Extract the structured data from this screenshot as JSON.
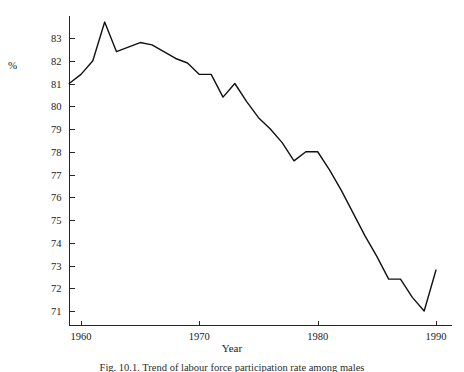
{
  "figure": {
    "caption": "Fig. 10.1. Trend of labour force participation rate among males",
    "ylabel": "%",
    "xlabel": "Year"
  },
  "chart_data": {
    "type": "line",
    "title": "",
    "xlabel": "Year",
    "ylabel": "%",
    "xlim": [
      1958,
      1990
    ],
    "ylim": [
      70.4,
      84.1
    ],
    "xticks": [
      1960,
      1970,
      1980,
      1990
    ],
    "yticks": [
      71,
      72,
      73,
      74,
      75,
      76,
      77,
      78,
      79,
      80,
      81,
      82,
      83
    ],
    "grid": false,
    "legend": null,
    "series": [
      {
        "name": "Participation rate",
        "x": [
          1959,
          1960,
          1961,
          1962,
          1963,
          1964,
          1965,
          1966,
          1967,
          1968,
          1969,
          1970,
          1971,
          1972,
          1973,
          1974,
          1975,
          1976,
          1977,
          1978,
          1979,
          1980,
          1981,
          1982,
          1983,
          1984,
          1985,
          1986,
          1987,
          1988,
          1989,
          1990
        ],
        "values": [
          81.0,
          81.4,
          82.0,
          83.7,
          82.4,
          82.6,
          82.8,
          82.7,
          82.4,
          82.1,
          81.9,
          81.4,
          81.4,
          80.4,
          81.0,
          80.2,
          79.5,
          79.0,
          78.4,
          77.6,
          78.0,
          78.0,
          77.2,
          76.3,
          75.3,
          74.3,
          73.4,
          72.4,
          72.4,
          71.6,
          71.0,
          72.8
        ]
      }
    ]
  }
}
